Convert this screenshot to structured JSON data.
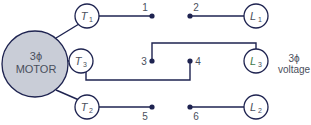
{
  "diagram": {
    "motor": {
      "line1": "3ϕ",
      "line2": "MOTOR"
    },
    "motor_terminals": [
      {
        "id": "T1",
        "letter": "T",
        "sub": "1"
      },
      {
        "id": "T3",
        "letter": "T",
        "sub": "3"
      },
      {
        "id": "T2",
        "letter": "T",
        "sub": "2"
      }
    ],
    "line_terminals": [
      {
        "id": "L1",
        "letter": "L",
        "sub": "1"
      },
      {
        "id": "L3",
        "letter": "L",
        "sub": "3"
      },
      {
        "id": "L2",
        "letter": "L",
        "sub": "2"
      }
    ],
    "contacts": [
      "1",
      "2",
      "3",
      "4",
      "5",
      "6"
    ],
    "source_label": {
      "line1": "3ϕ",
      "line2": "voltage"
    },
    "connections": [
      {
        "from": "T1",
        "to": "1"
      },
      {
        "from": "2",
        "to": "L1"
      },
      {
        "from": "T3",
        "to": "4"
      },
      {
        "from": "3",
        "to": "L3"
      },
      {
        "from": "T2",
        "to": "5"
      },
      {
        "from": "6",
        "to": "L2"
      }
    ]
  }
}
